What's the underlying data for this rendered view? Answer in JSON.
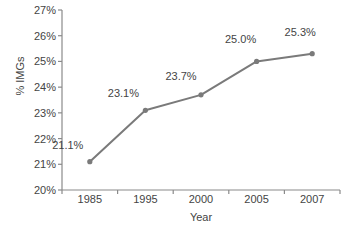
{
  "chart_data": {
    "type": "line",
    "title": "",
    "xlabel": "Year",
    "ylabel": "% IMGs",
    "categories": [
      "1985",
      "1995",
      "2000",
      "2005",
      "2007"
    ],
    "values": [
      21.1,
      23.1,
      23.7,
      25.0,
      25.3
    ],
    "point_labels": [
      "21.1%",
      "23.1%",
      "23.7%",
      "25.0%",
      "25.3%"
    ],
    "ylim": [
      20,
      27
    ],
    "ytick_values": [
      20,
      21,
      22,
      23,
      24,
      25,
      26,
      27
    ],
    "ytick_labels": [
      "20%",
      "21%",
      "22%",
      "23%",
      "24%",
      "25%",
      "26%",
      "27%"
    ],
    "grid": false,
    "legend": null,
    "series_color": "#7a7a7a",
    "axis_color": "#8a8a8a",
    "text_color": "#444444"
  }
}
